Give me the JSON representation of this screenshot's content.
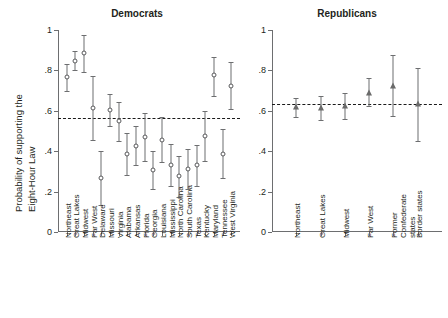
{
  "figure": {
    "ylabel_line1": "Probability of supporting the",
    "ylabel_line2": "Eight-Hour Law",
    "y_ticks": [
      "0",
      ".2",
      ".4",
      ".6",
      ".8",
      "1"
    ],
    "y_tick_values": [
      0,
      0.2,
      0.4,
      0.6,
      0.8,
      1.0
    ]
  },
  "chart_data": [
    {
      "type": "scatter",
      "title": "Democrats",
      "xlabel": "",
      "ylabel": "Probability of supporting the Eight-Hour Law",
      "ylim": [
        0,
        1
      ],
      "yticks": [
        0,
        0.2,
        0.4,
        0.6,
        0.8,
        1.0
      ],
      "ytick_labels": [
        "0",
        ".2",
        ".4",
        ".6",
        ".8",
        "1"
      ],
      "grid": false,
      "legend": "none",
      "marker": "open-circle",
      "reference_line": {
        "value": 0.565,
        "style": "dashed",
        "label": ""
      },
      "categories": [
        "Northeast",
        "Great Lakes",
        "Midwest",
        "Far West",
        "Delaware",
        "Missouri",
        "Virginia",
        "Alabama",
        "Arkansas",
        "Florida",
        "Georgia",
        "Louisiana",
        "Mississippi",
        "North Carolina",
        "South Carolina",
        "Texas",
        "Kentucky",
        "Maryland",
        "Tennessee",
        "West Virginia"
      ],
      "values": [
        0.765,
        0.845,
        0.885,
        0.615,
        0.265,
        0.605,
        0.55,
        0.385,
        0.425,
        0.47,
        0.305,
        0.455,
        0.33,
        0.275,
        0.31,
        0.33,
        0.475,
        0.775,
        0.385,
        0.725
      ],
      "error_low": [
        0.7,
        0.8,
        0.79,
        0.455,
        0.135,
        0.525,
        0.45,
        0.28,
        0.33,
        0.35,
        0.215,
        0.345,
        0.23,
        0.175,
        0.215,
        0.23,
        0.35,
        0.675,
        0.265,
        0.61
      ],
      "error_high": [
        0.83,
        0.895,
        0.975,
        0.77,
        0.4,
        0.685,
        0.645,
        0.49,
        0.525,
        0.59,
        0.4,
        0.57,
        0.435,
        0.375,
        0.41,
        0.43,
        0.6,
        0.865,
        0.51,
        0.84
      ]
    },
    {
      "type": "scatter",
      "title": "Republicans",
      "xlabel": "",
      "ylabel": "Probability of supporting the Eight-Hour Law",
      "ylim": [
        0,
        1
      ],
      "yticks": [
        0,
        0.2,
        0.4,
        0.6,
        0.8,
        1.0
      ],
      "ytick_labels": [
        "0",
        ".2",
        ".4",
        ".6",
        ".8",
        "1"
      ],
      "grid": false,
      "legend": "none",
      "marker": "filled-triangle",
      "reference_line": {
        "value": 0.632,
        "style": "dashed",
        "label": ""
      },
      "categories": [
        "Northeast",
        "Great Lakes",
        "Midwest",
        "Far West",
        "Former Confederate states",
        "Border states"
      ],
      "category_lines": [
        [
          "Northeast"
        ],
        [
          "Great Lakes"
        ],
        [
          "Midwest"
        ],
        [
          "Far West"
        ],
        [
          "Former",
          "Confederate",
          "states"
        ],
        [
          "Border states"
        ]
      ],
      "values": [
        0.618,
        0.613,
        0.625,
        0.69,
        0.723,
        0.632
      ],
      "error_low": [
        0.57,
        0.555,
        0.56,
        0.625,
        0.575,
        0.45
      ],
      "error_high": [
        0.665,
        0.672,
        0.69,
        0.76,
        0.875,
        0.81
      ]
    }
  ]
}
